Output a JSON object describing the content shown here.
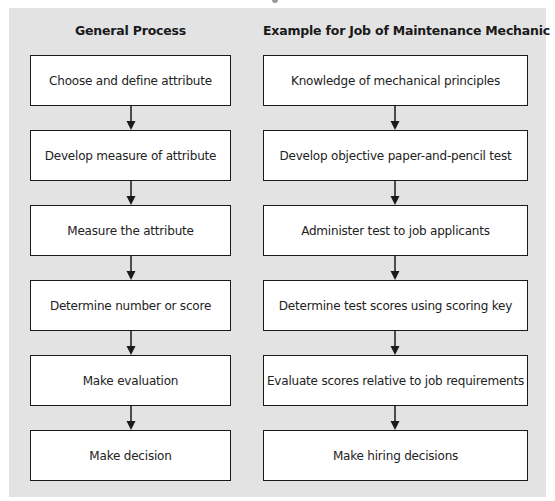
{
  "diagram": {
    "columns": [
      {
        "header": "General Process",
        "steps": [
          "Choose and define attribute",
          "Develop measure of attribute",
          "Measure the attribute",
          "Determine number or score",
          "Make evaluation",
          "Make decision"
        ]
      },
      {
        "header": "Example for Job of Maintenance Mechanic",
        "steps": [
          "Knowledge of mechanical principles",
          "Develop objective paper-and-pencil test",
          "Administer test to job applicants",
          "Determine test scores using scoring key",
          "Evaluate scores relative to job requirements",
          "Make hiring decisions"
        ]
      }
    ],
    "colors": {
      "panel": "#e3e3e3",
      "box_fill": "#ffffff",
      "border": "#1a1a1a",
      "arrow": "#1a1a1a"
    }
  }
}
